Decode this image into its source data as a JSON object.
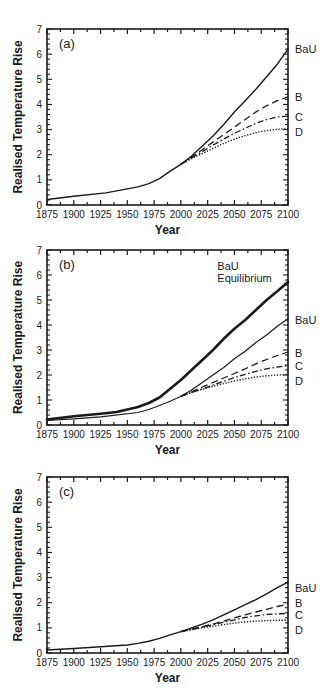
{
  "figure": {
    "x_axis_title": "Year",
    "y_axis_title": "Realised  Temperature  Rise"
  },
  "chart_data": [
    {
      "type": "line",
      "panel_label": "(a)",
      "xlabel": "Year",
      "ylabel": "Realised Temperature Rise",
      "xlim": [
        1875,
        2100
      ],
      "ylim": [
        0,
        7
      ],
      "x_ticks": [
        1875,
        1900,
        1925,
        1950,
        1975,
        2000,
        2025,
        2050,
        2075,
        2100
      ],
      "y_ticks": [
        0,
        1,
        2,
        3,
        4,
        5,
        6,
        7
      ],
      "grid": false,
      "legend": "direct labels at right of plot",
      "series": [
        {
          "name": "BaU",
          "style": "solid",
          "width": 1.4,
          "x": [
            1875,
            1900,
            1930,
            1960,
            1970,
            1980,
            1990,
            2000,
            2010,
            2020,
            2030,
            2040,
            2050,
            2060,
            2070,
            2080,
            2090,
            2100
          ],
          "y": [
            0.22,
            0.35,
            0.48,
            0.72,
            0.85,
            1.05,
            1.35,
            1.62,
            1.95,
            2.35,
            2.75,
            3.2,
            3.7,
            4.15,
            4.6,
            5.1,
            5.6,
            6.2
          ]
        },
        {
          "name": "B",
          "style": "dashed",
          "width": 1.3,
          "x": [
            2000,
            2010,
            2020,
            2030,
            2040,
            2050,
            2060,
            2070,
            2080,
            2090,
            2100
          ],
          "y": [
            1.62,
            1.9,
            2.2,
            2.5,
            2.8,
            3.1,
            3.4,
            3.7,
            3.95,
            4.15,
            4.3
          ]
        },
        {
          "name": "C",
          "style": "dashdot",
          "width": 1.3,
          "x": [
            2000,
            2010,
            2020,
            2030,
            2040,
            2050,
            2060,
            2070,
            2080,
            2090,
            2100
          ],
          "y": [
            1.62,
            1.88,
            2.12,
            2.38,
            2.62,
            2.85,
            3.05,
            3.25,
            3.4,
            3.5,
            3.53
          ]
        },
        {
          "name": "D",
          "style": "dotted",
          "width": 1.4,
          "x": [
            2000,
            2010,
            2020,
            2030,
            2040,
            2050,
            2060,
            2070,
            2080,
            2090,
            2100
          ],
          "y": [
            1.62,
            1.85,
            2.05,
            2.25,
            2.45,
            2.62,
            2.76,
            2.88,
            2.96,
            3.01,
            3.04
          ]
        }
      ],
      "labels": [
        {
          "text": "BaU",
          "y": 6.2
        },
        {
          "text": "B",
          "y": 4.3
        },
        {
          "text": "C",
          "y": 3.5
        },
        {
          "text": "D",
          "y": 2.9
        }
      ],
      "annotations": []
    },
    {
      "type": "line",
      "panel_label": "(b)",
      "xlabel": "Year",
      "ylabel": "Realised Temperature Rise",
      "xlim": [
        1875,
        2100
      ],
      "ylim": [
        0,
        7
      ],
      "x_ticks": [
        1875,
        1900,
        1925,
        1950,
        1975,
        2000,
        2025,
        2050,
        2075,
        2100
      ],
      "y_ticks": [
        0,
        1,
        2,
        3,
        4,
        5,
        6,
        7
      ],
      "grid": false,
      "legend": "direct labels at right of plot",
      "series": [
        {
          "name": "BaU Equilibrium",
          "style": "solid",
          "width": 2.6,
          "x": [
            1875,
            1900,
            1925,
            1940,
            1960,
            1970,
            1980,
            1990,
            2000,
            2010,
            2020,
            2030,
            2040,
            2050,
            2060,
            2070,
            2080,
            2090,
            2100
          ],
          "y": [
            0.22,
            0.35,
            0.45,
            0.52,
            0.72,
            0.88,
            1.1,
            1.45,
            1.8,
            2.2,
            2.6,
            3.0,
            3.45,
            3.85,
            4.2,
            4.6,
            5.0,
            5.35,
            5.72
          ]
        },
        {
          "name": "BaU",
          "style": "solid",
          "width": 1.2,
          "x": [
            1875,
            1900,
            1925,
            1960,
            1970,
            1980,
            1990,
            2000,
            2010,
            2020,
            2030,
            2040,
            2050,
            2060,
            2070,
            2080,
            2090,
            2100
          ],
          "y": [
            0.18,
            0.25,
            0.33,
            0.5,
            0.62,
            0.78,
            0.95,
            1.15,
            1.4,
            1.7,
            2.0,
            2.3,
            2.65,
            2.95,
            3.3,
            3.6,
            3.95,
            4.25
          ]
        },
        {
          "name": "B",
          "style": "dashed",
          "width": 1.3,
          "x": [
            2000,
            2010,
            2020,
            2030,
            2040,
            2050,
            2060,
            2070,
            2080,
            2090,
            2100
          ],
          "y": [
            1.15,
            1.33,
            1.52,
            1.7,
            1.88,
            2.06,
            2.25,
            2.45,
            2.62,
            2.78,
            2.92
          ]
        },
        {
          "name": "C",
          "style": "dashdot",
          "width": 1.3,
          "x": [
            2000,
            2010,
            2020,
            2030,
            2040,
            2050,
            2060,
            2070,
            2080,
            2090,
            2100
          ],
          "y": [
            1.15,
            1.3,
            1.45,
            1.6,
            1.75,
            1.9,
            2.03,
            2.15,
            2.25,
            2.32,
            2.37
          ]
        },
        {
          "name": "D",
          "style": "dotted",
          "width": 1.4,
          "x": [
            2000,
            2010,
            2020,
            2030,
            2040,
            2050,
            2060,
            2070,
            2080,
            2090,
            2100
          ],
          "y": [
            1.15,
            1.3,
            1.43,
            1.55,
            1.66,
            1.76,
            1.85,
            1.92,
            1.97,
            2.0,
            2.02
          ]
        }
      ],
      "labels": [
        {
          "text": "BaU",
          "y": 4.2
        },
        {
          "text": "B",
          "y": 2.9
        },
        {
          "text": "C",
          "y": 2.35
        },
        {
          "text": "D",
          "y": 1.75
        }
      ],
      "annotations": [
        {
          "text": "BaU",
          "x": 2034,
          "y": 6.22
        },
        {
          "text": "Equilibrium",
          "x": 2034,
          "y": 5.72
        }
      ]
    },
    {
      "type": "line",
      "panel_label": "(c)",
      "xlabel": "Year",
      "ylabel": "Realised Temperature Rise",
      "xlim": [
        1875,
        2100
      ],
      "ylim": [
        0,
        7
      ],
      "x_ticks": [
        1875,
        1900,
        1925,
        1950,
        1975,
        2000,
        2025,
        2050,
        2075,
        2100
      ],
      "y_ticks": [
        0,
        1,
        2,
        3,
        4,
        5,
        6,
        7
      ],
      "grid": false,
      "legend": "direct labels at right of plot",
      "series": [
        {
          "name": "BaU",
          "style": "solid",
          "width": 1.4,
          "x": [
            1875,
            1900,
            1925,
            1950,
            1960,
            1970,
            1980,
            1990,
            2000,
            2010,
            2020,
            2030,
            2040,
            2050,
            2060,
            2070,
            2080,
            2090,
            2100
          ],
          "y": [
            0.12,
            0.18,
            0.25,
            0.32,
            0.38,
            0.47,
            0.58,
            0.72,
            0.85,
            1.0,
            1.15,
            1.32,
            1.52,
            1.72,
            1.92,
            2.12,
            2.35,
            2.6,
            2.82
          ]
        },
        {
          "name": "B",
          "style": "dashed",
          "width": 1.3,
          "x": [
            2000,
            2010,
            2020,
            2030,
            2040,
            2050,
            2060,
            2070,
            2080,
            2090,
            2100
          ],
          "y": [
            0.85,
            0.95,
            1.05,
            1.15,
            1.27,
            1.4,
            1.52,
            1.63,
            1.74,
            1.85,
            1.95
          ]
        },
        {
          "name": "C",
          "style": "dashdot",
          "width": 1.3,
          "x": [
            2000,
            2010,
            2020,
            2030,
            2040,
            2050,
            2060,
            2070,
            2080,
            2090,
            2100
          ],
          "y": [
            0.85,
            0.94,
            1.03,
            1.12,
            1.22,
            1.32,
            1.41,
            1.48,
            1.53,
            1.56,
            1.57
          ]
        },
        {
          "name": "D",
          "style": "dotted",
          "width": 1.4,
          "x": [
            2000,
            2010,
            2020,
            2030,
            2040,
            2050,
            2060,
            2070,
            2080,
            2090,
            2100
          ],
          "y": [
            0.85,
            0.93,
            1.0,
            1.07,
            1.13,
            1.19,
            1.24,
            1.27,
            1.29,
            1.3,
            1.3
          ]
        }
      ],
      "labels": [
        {
          "text": "BaU",
          "y": 2.6
        },
        {
          "text": "B",
          "y": 2.0
        },
        {
          "text": "C",
          "y": 1.5
        },
        {
          "text": "D",
          "y": 0.9
        }
      ],
      "annotations": []
    }
  ]
}
